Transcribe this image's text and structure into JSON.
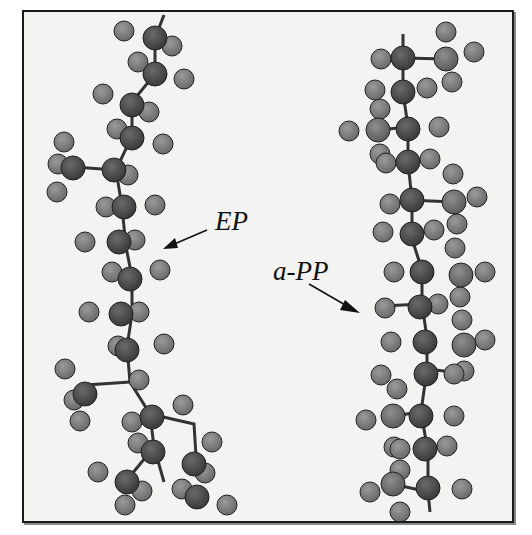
{
  "figure": {
    "labels": {
      "ep": "EP",
      "app": "a-PP"
    },
    "colors": {
      "background": "#f3f3f1",
      "frame": "#1a1a1a",
      "carbon": "#4a4a4a",
      "hydrogen": "#7d7d7d",
      "methyl_carbon": "#6e6e6e"
    },
    "molecules": [
      {
        "name": "EP",
        "description": "ethylene-propylene chain (ball-and-stick)"
      },
      {
        "name": "a-PP",
        "description": "atactic polypropylene chain (ball-and-stick)"
      }
    ]
  }
}
